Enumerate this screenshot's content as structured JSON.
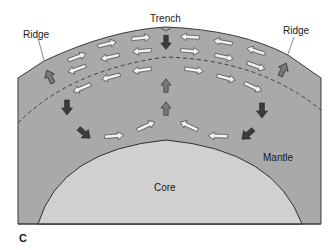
{
  "figure": {
    "panel_label": "C",
    "labels": {
      "trench": "Trench",
      "ridge_left": "Ridge",
      "ridge_right": "Ridge",
      "mantle": "Mantle",
      "core": "Core"
    },
    "colors": {
      "mantle_fill": "#a9a9a9",
      "core_fill": "#d0d0d0",
      "outline": "#3a3a3a",
      "arrow_hollow_fill": "#f2f2f2",
      "arrow_gray_fill": "#7a7a7a",
      "arrow_dark_fill": "#3c3c3c"
    },
    "arrow_legend": {
      "hollow": "flow in upper convection layer",
      "gray": "rising material",
      "dark": "sinking material"
    }
  }
}
